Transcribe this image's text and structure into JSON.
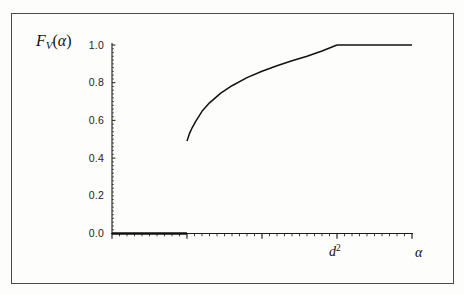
{
  "figure": {
    "background_color": "#fdfdfc",
    "frame_color": "#4a4a4a",
    "curve_color": "#111111",
    "ylabel_text": "F",
    "ylabel_sub": "V",
    "ylabel_arg_open": "(",
    "ylabel_arg": "α",
    "ylabel_arg_close": ")",
    "xlabel_d2_base": "d",
    "xlabel_d2_sup": "2",
    "xlabel_alpha": "α"
  },
  "chart_data": {
    "type": "line",
    "title": "",
    "subtitle": "",
    "xlabel": "α",
    "ylabel": "F_V(α)",
    "grid": false,
    "legend_position": "none",
    "xlim": [
      0,
      4
    ],
    "ylim": [
      0,
      1.05
    ],
    "yticks": [
      0.0,
      0.2,
      0.4,
      0.6,
      0.8,
      1.0
    ],
    "ytick_labels": [
      "0.0",
      "0.2",
      "0.4",
      "0.6",
      "0.8",
      "1.0"
    ],
    "xticks": [
      0,
      1,
      2,
      3,
      4
    ],
    "xtick_labels": [
      "",
      "",
      "",
      "d²",
      "α"
    ],
    "xminor_tick_count_per_major": 10,
    "annotations": [
      {
        "text": "d²",
        "x": 3.0,
        "y": 0,
        "placement": "below-axis"
      },
      {
        "text": "α",
        "x": 4.0,
        "y": 0,
        "placement": "axis-end"
      }
    ],
    "series": [
      {
        "name": "F_V(alpha) zero segment",
        "style": "solid-thick",
        "x": [
          0.0,
          1.0
        ],
        "values": [
          0.0,
          0.0
        ]
      },
      {
        "name": "F_V(alpha) rising branch",
        "style": "solid",
        "x": [
          1.0,
          1.03,
          1.07,
          1.12,
          1.2,
          1.3,
          1.45,
          1.6,
          1.8,
          2.0,
          2.2,
          2.4,
          2.6,
          2.8,
          3.0
        ],
        "values": [
          0.49,
          0.527,
          0.562,
          0.598,
          0.648,
          0.693,
          0.745,
          0.784,
          0.827,
          0.861,
          0.89,
          0.916,
          0.94,
          0.968,
          1.0
        ]
      },
      {
        "name": "F_V(alpha) saturated segment",
        "style": "solid",
        "x": [
          3.0,
          4.0
        ],
        "values": [
          1.0,
          1.0
        ]
      }
    ],
    "jump_discontinuity": {
      "x": 1.0,
      "from": 0.0,
      "to": 0.49
    },
    "saturation_point": {
      "x": 3.0,
      "y": 1.0
    }
  }
}
